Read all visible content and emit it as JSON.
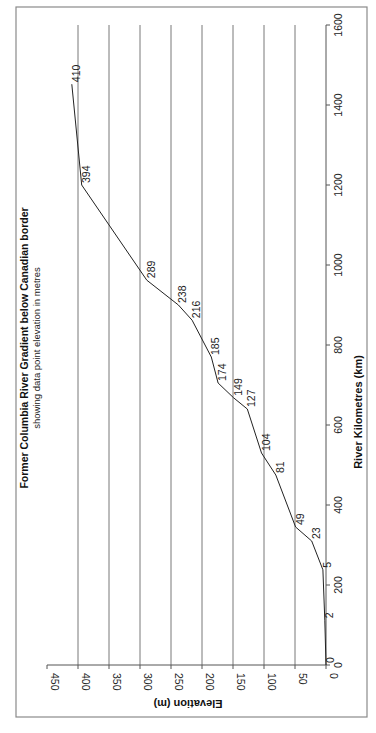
{
  "chart_data": {
    "type": "line",
    "orientation": "rotated 90 degrees clockwise (x-axis runs vertically bottom-to-top, y-axis runs horizontally right-to-left)",
    "title": "Former Columbia River Gradient below Canadian border",
    "subtitle": "showing data point elevation in metres",
    "xlabel": "River Kilometres (km)",
    "ylabel": "Elevation (m)",
    "xlim": [
      0,
      1600
    ],
    "ylim": [
      0,
      450
    ],
    "x_ticks": [
      0,
      200,
      400,
      600,
      800,
      1000,
      1200,
      1400,
      1600
    ],
    "y_ticks": [
      0,
      50,
      100,
      150,
      200,
      250,
      300,
      350,
      400,
      450
    ],
    "grid": "horizontal gridlines at each y tick",
    "legend": "none",
    "series": [
      {
        "name": "Elevation",
        "x": [
          0,
          112,
          238,
          310,
          345,
          475,
          530,
          640,
          668,
          705,
          770,
          862,
          900,
          962,
          1200,
          1452
        ],
        "values": [
          0,
          2,
          5,
          23,
          49,
          81,
          104,
          127,
          149,
          174,
          185,
          216,
          238,
          289,
          394,
          410
        ],
        "data_labels": [
          "0",
          "2",
          "5",
          "23",
          "49",
          "81",
          "104",
          "127",
          "149",
          "174",
          "185",
          "216",
          "238",
          "289",
          "394",
          "410"
        ]
      }
    ]
  }
}
